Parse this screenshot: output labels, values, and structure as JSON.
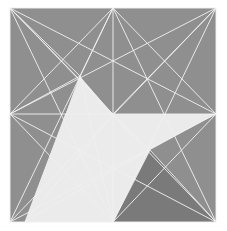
{
  "artwork": {
    "title": "Geometric Line Composition",
    "width": 227,
    "height": 231,
    "background_color": "#ffffff"
  },
  "palette": {
    "canvas_background": "#ffffff",
    "field_gray": "#8f8f8f",
    "dark_triangle": "#262626",
    "light_triangle": "#ebebeb",
    "mid_triangle": "#7a7a7a",
    "line_color": "#f0f0f0",
    "line_color_soft": "#d8d8d8"
  },
  "geometry": {
    "square": {
      "top_left": [
        10,
        8
      ],
      "top_right": [
        216,
        8
      ],
      "bottom_right": [
        216,
        222
      ],
      "bottom_left": [
        10,
        222
      ]
    },
    "vertices": {
      "top_left": [
        10,
        8
      ],
      "top_mid": [
        113,
        8
      ],
      "top_right": [
        216,
        8
      ],
      "mid_left": [
        10,
        114
      ],
      "center": [
        113,
        114
      ],
      "mid_right": [
        216,
        114
      ],
      "bottom_left": [
        10,
        222
      ],
      "bottom_mid": [
        113,
        222
      ],
      "bottom_right": [
        216,
        222
      ],
      "apex_dark": [
        80,
        76
      ],
      "node_upper_center": [
        113,
        60
      ],
      "node_right_upper": [
        160,
        85
      ],
      "node_left_lower": [
        78,
        160
      ],
      "node_right_lower": [
        150,
        150
      ],
      "node_bottom_inner": [
        113,
        170
      ],
      "light_left_base": [
        25,
        222
      ],
      "light_apex": [
        80,
        76
      ]
    },
    "shapes": [
      {
        "name": "background-field",
        "fill_key": "field_gray",
        "points": "10,8 216,8 216,222 10,222"
      },
      {
        "name": "dark-triangle",
        "fill_key": "dark_triangle",
        "points": "80,76 113,114 65,114"
      },
      {
        "name": "light-triangle-main",
        "fill_key": "light_triangle",
        "points": "80,76 113,114 113,222 25,222"
      },
      {
        "name": "light-triangle-right",
        "fill_key": "light_triangle",
        "points": "113,114 216,114 150,150 113,222"
      },
      {
        "name": "mid-triangle-bottom-right",
        "fill_key": "mid_triangle",
        "points": "113,222 150,150 216,222"
      }
    ],
    "lines": [
      {
        "name": "border-top",
        "from": [
          10,
          8
        ],
        "to": [
          216,
          8
        ]
      },
      {
        "name": "border-right",
        "from": [
          216,
          8
        ],
        "to": [
          216,
          222
        ]
      },
      {
        "name": "border-bottom",
        "from": [
          10,
          222
        ],
        "to": [
          216,
          222
        ]
      },
      {
        "name": "border-left",
        "from": [
          10,
          8
        ],
        "to": [
          10,
          222
        ]
      },
      {
        "name": "axis-vertical-center",
        "from": [
          113,
          8
        ],
        "to": [
          113,
          222
        ]
      },
      {
        "name": "axis-horizontal-center",
        "from": [
          10,
          114
        ],
        "to": [
          216,
          114
        ]
      },
      {
        "name": "diag-tl-br",
        "from": [
          10,
          8
        ],
        "to": [
          216,
          222
        ]
      },
      {
        "name": "diag-tr-bl",
        "from": [
          216,
          8
        ],
        "to": [
          10,
          222
        ]
      },
      {
        "name": "tl-to-midright",
        "from": [
          10,
          8
        ],
        "to": [
          216,
          114
        ]
      },
      {
        "name": "tl-to-bottommid",
        "from": [
          10,
          8
        ],
        "to": [
          113,
          222
        ]
      },
      {
        "name": "tl-to-center",
        "from": [
          10,
          8
        ],
        "to": [
          113,
          114
        ]
      },
      {
        "name": "tr-to-midleft",
        "from": [
          216,
          8
        ],
        "to": [
          10,
          114
        ]
      },
      {
        "name": "tr-to-bottommid",
        "from": [
          216,
          8
        ],
        "to": [
          113,
          222
        ]
      },
      {
        "name": "tr-to-center",
        "from": [
          216,
          8
        ],
        "to": [
          113,
          114
        ]
      },
      {
        "name": "bl-to-midright",
        "from": [
          10,
          222
        ],
        "to": [
          216,
          114
        ]
      },
      {
        "name": "bl-to-topmid",
        "from": [
          10,
          222
        ],
        "to": [
          113,
          8
        ]
      },
      {
        "name": "br-to-midleft",
        "from": [
          216,
          222
        ],
        "to": [
          10,
          114
        ]
      },
      {
        "name": "br-to-topmid",
        "from": [
          216,
          222
        ],
        "to": [
          113,
          8
        ]
      },
      {
        "name": "topmid-to-midleft",
        "from": [
          113,
          8
        ],
        "to": [
          10,
          114
        ]
      },
      {
        "name": "topmid-to-midright",
        "from": [
          113,
          8
        ],
        "to": [
          216,
          114
        ]
      },
      {
        "name": "midleft-to-bottommid",
        "from": [
          10,
          114
        ],
        "to": [
          113,
          222
        ]
      },
      {
        "name": "midright-to-bottommid",
        "from": [
          216,
          114
        ],
        "to": [
          113,
          222
        ]
      },
      {
        "name": "apex-to-midleft",
        "from": [
          80,
          76
        ],
        "to": [
          10,
          114
        ]
      },
      {
        "name": "apex-to-topleft",
        "from": [
          80,
          76
        ],
        "to": [
          10,
          8
        ]
      },
      {
        "name": "apex-to-topmid",
        "from": [
          80,
          76
        ],
        "to": [
          113,
          8
        ]
      },
      {
        "name": "apex-to-bottomleft",
        "from": [
          80,
          76
        ],
        "to": [
          25,
          222
        ]
      },
      {
        "name": "apex-to-bottommid",
        "from": [
          80,
          76
        ],
        "to": [
          113,
          222
        ]
      },
      {
        "name": "lightbase-to-center",
        "from": [
          25,
          222
        ],
        "to": [
          113,
          114
        ]
      },
      {
        "name": "center-to-nodelower",
        "from": [
          113,
          114
        ],
        "to": [
          150,
          150
        ]
      },
      {
        "name": "nodelower-to-bottomright",
        "from": [
          150,
          150
        ],
        "to": [
          216,
          222
        ]
      },
      {
        "name": "nodelower-to-bottommid",
        "from": [
          150,
          150
        ],
        "to": [
          113,
          222
        ]
      },
      {
        "name": "inner-bottom-fan-left",
        "from": [
          113,
          170
        ],
        "to": [
          25,
          222
        ]
      },
      {
        "name": "inner-bottom-fan-center",
        "from": [
          113,
          170
        ],
        "to": [
          113,
          222
        ]
      },
      {
        "name": "inner-bottom-fan-right",
        "from": [
          113,
          170
        ],
        "to": [
          150,
          150
        ]
      }
    ]
  }
}
